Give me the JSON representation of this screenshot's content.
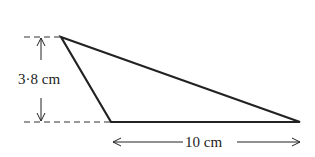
{
  "diagram": {
    "shape": "triangle",
    "height_label": "3·8 cm",
    "base_label": "10 cm",
    "vertices": {
      "apex": [
        61,
        37
      ],
      "base_left": [
        111,
        122
      ],
      "base_right": [
        300,
        122
      ]
    },
    "colors": {
      "stroke": "#222222",
      "background": "#ffffff"
    }
  }
}
